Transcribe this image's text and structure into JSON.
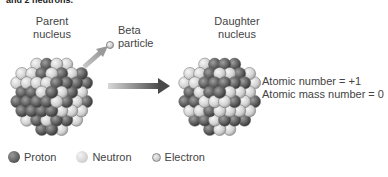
{
  "header": {
    "cut_off_title": "and 2 neutrons."
  },
  "labels": {
    "parent_nucleus": [
      "Parent",
      "nucleus"
    ],
    "daughter_nucleus": [
      "Daughter",
      "nucleus"
    ],
    "beta_particle": [
      "Beta",
      "particle"
    ]
  },
  "info": {
    "atomic_number": "Atomic number = +1",
    "atomic_mass_number": "Atomic mass number = 0"
  },
  "legend": [
    {
      "key": "proton",
      "label": "Proton",
      "color": "#5a5a5a"
    },
    {
      "key": "neutron",
      "label": "Neutron",
      "color": "#d0d0d0"
    },
    {
      "key": "electron",
      "label": "Electron",
      "color": "#c4c4c4"
    }
  ],
  "colors": {
    "proton": "#5a5a5a",
    "neutron": "#d6d6d6",
    "arrow": "#555555",
    "emission_arrow": "#b0b0b0"
  }
}
